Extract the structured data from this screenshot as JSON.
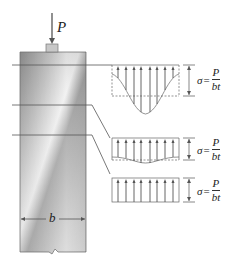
{
  "diagram": {
    "load_label": "P",
    "width_label": "b",
    "sections": [
      {
        "name": "top",
        "profile": "bell-curve",
        "stress_symbol": "σ",
        "equals": "=",
        "numerator": "P",
        "denominator": "bt"
      },
      {
        "name": "middle",
        "profile": "slightly-nonuniform",
        "stress_symbol": "σ",
        "equals": "=",
        "numerator": "P",
        "denominator": "bt"
      },
      {
        "name": "bottom",
        "profile": "uniform",
        "stress_symbol": "σ",
        "equals": "=",
        "numerator": "P",
        "denominator": "bt"
      }
    ],
    "colors": {
      "line": "#555555",
      "column_light": "#e8e8e8",
      "column_dark": "#9a9a9a",
      "cap": "#c8c8c8"
    }
  }
}
